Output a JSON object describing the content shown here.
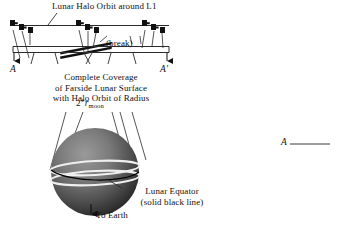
{
  "figure": {
    "title_halo_orbit": "Lunar Halo Orbit around L1",
    "break_label": "(break)",
    "section_left": "A",
    "section_right": "A′",
    "coverage_line1": "Complete Coverage",
    "coverage_line2": "of Farside Lunar Surface",
    "coverage_line3": "with Halo Orbit of Radius",
    "radius_value": "2",
    "radius_star": "*",
    "radius_symbol": "r",
    "radius_subscript": "moon",
    "equator_line1": "Lunar Equator",
    "equator_line2": "(solid black line)",
    "to_earth": "To Earth",
    "right_marker": "A"
  },
  "colors": {
    "ink": "#111111",
    "line": "#2b2b2b",
    "moon_light": "#8d8d8d",
    "moon_dark": "#2a2a2a",
    "equator": "#000000",
    "orbit_band": "#f2f2f2",
    "background": "#ffffff"
  }
}
